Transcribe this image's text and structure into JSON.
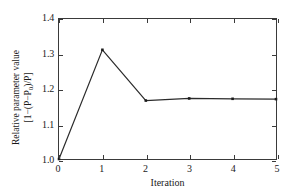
{
  "chart_data": {
    "type": "line",
    "title": "",
    "xlabel": "Iteration",
    "ylabel_line1": "Relative parameter value",
    "ylabel_line2_prefix": "[1−(P−P",
    "ylabel_line2_sub": "0",
    "ylabel_line2_suffix": ")/P]",
    "ylabel_plain": "Relative parameter value [1−(P−P0)/P]",
    "x": [
      0,
      1,
      2,
      3,
      4,
      5
    ],
    "values": [
      1.0,
      1.312,
      1.167,
      1.173,
      1.172,
      1.171
    ],
    "xlim": [
      0,
      5
    ],
    "ylim": [
      1.0,
      1.4
    ],
    "xticks": [
      0,
      1,
      2,
      3,
      4,
      5
    ],
    "xtick_labels": [
      "0",
      "1",
      "2",
      "3",
      "4",
      "5"
    ],
    "yticks": [
      1.0,
      1.1,
      1.2,
      1.3,
      1.4
    ],
    "ytick_labels": [
      "1.0",
      "1.1",
      "1.2",
      "1.3",
      "1.4"
    ],
    "grid": false,
    "legend": false,
    "marker": "square",
    "line_color": "#2b2b2b",
    "marker_color": "#1a1a1a",
    "axis_color": "#3a3a3a",
    "background": "#ffffff"
  }
}
